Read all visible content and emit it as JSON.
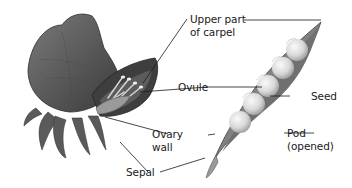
{
  "diagram": {
    "labels": {
      "upper_carpel_line1": "Upper part",
      "upper_carpel_line2": "of carpel",
      "ovule": "Ovule",
      "seed": "Seed",
      "ovary_line1": "Ovary",
      "ovary_line2": "wall",
      "pod_line1": "Pod",
      "pod_line2": "(opened)",
      "sepal": "Sepal"
    },
    "colors": {
      "background": "#ffffff",
      "flower_dark": "#3a3a3a",
      "flower_mid": "#6e6e6e",
      "pod_mid": "#8a8a8a",
      "seed_light": "#e6e6e6",
      "leader_line": "#1a1a1a",
      "text": "#1a1a1a"
    }
  }
}
